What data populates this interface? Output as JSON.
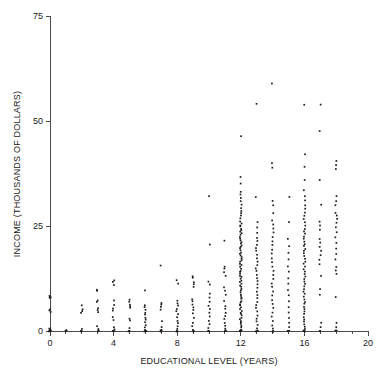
{
  "figure": {
    "clipped_title": "",
    "background_color": "#ffffff",
    "point_color": "#1c1c1c",
    "axis_color": "#4a4a4a"
  },
  "chart_data": {
    "type": "scatter",
    "title": "",
    "xlabel": "EDUCATIONAL LEVEL (YEARS)",
    "ylabel": "INCOME (THOUSANDS OF DOLLARS)",
    "xlim": [
      0,
      20
    ],
    "ylim": [
      0,
      75
    ],
    "xticks": [
      0,
      4,
      8,
      12,
      16,
      20
    ],
    "xticklabels": [
      "0",
      "4",
      "8",
      "12",
      "16",
      "20"
    ],
    "xminorticks": [
      1,
      2,
      3,
      5,
      6,
      7,
      9,
      10,
      11,
      13,
      14,
      15,
      17,
      18,
      19
    ],
    "yticks": [
      0,
      25,
      50,
      75
    ],
    "yticklabels": [
      "0",
      "25",
      "50",
      "75"
    ],
    "grid": false,
    "legend": null,
    "columns": [
      {
        "x": 0,
        "values": [
          0,
          0,
          0,
          0,
          0,
          0.4,
          0.6,
          4.5,
          4.8,
          5.2,
          7.8,
          8.0,
          8.2,
          8.4
        ]
      },
      {
        "x": 1,
        "values": [
          0,
          0,
          0.3
        ]
      },
      {
        "x": 2,
        "values": [
          0,
          0,
          0,
          0.5,
          4.4,
          4.8,
          5.1,
          6.0
        ]
      },
      {
        "x": 3,
        "values": [
          0,
          0,
          0,
          0.4,
          1.2,
          4.6,
          5.0,
          5.5,
          7.0,
          7.4,
          9.5,
          9.8
        ]
      },
      {
        "x": 4,
        "values": [
          0,
          0,
          0,
          0.3,
          1.0,
          2.6,
          3.2,
          4.8,
          5.4,
          6.2,
          7.2,
          11.0,
          11.6,
          12.0
        ]
      },
      {
        "x": 5,
        "values": [
          0,
          0,
          0,
          0.6,
          2.4,
          3.0,
          5.5,
          6.0,
          6.4,
          7.0,
          7.4
        ]
      },
      {
        "x": 6,
        "values": [
          0,
          0,
          0,
          0,
          0.3,
          0.8,
          1.4,
          2.0,
          2.6,
          3.2,
          3.8,
          4.4,
          5.0,
          5.6,
          6.0,
          9.6
        ]
      },
      {
        "x": 7,
        "values": [
          0,
          0,
          0,
          0.4,
          1.0,
          2.2,
          5.2,
          5.8,
          6.2,
          6.6,
          15.5
        ]
      },
      {
        "x": 8,
        "values": [
          0,
          0,
          0,
          0,
          0.5,
          1.2,
          1.8,
          2.4,
          3.2,
          4.0,
          4.6,
          5.2,
          6.0,
          6.6,
          7.2,
          11.4,
          12.2
        ]
      },
      {
        "x": 9,
        "values": [
          0,
          0,
          0,
          0.4,
          1.2,
          2.0,
          3.0,
          4.2,
          5.0,
          5.6,
          6.4,
          7.0,
          7.6,
          10.4,
          11.0,
          11.6,
          12.6,
          13.0
        ]
      },
      {
        "x": 10,
        "values": [
          0,
          0,
          0,
          0.6,
          1.5,
          2.4,
          3.6,
          4.4,
          5.2,
          6.0,
          7.0,
          8.0,
          8.8,
          11.0,
          11.8,
          20.6,
          32.0
        ]
      },
      {
        "x": 11,
        "values": [
          0,
          0,
          0,
          0,
          0.5,
          1.2,
          2.0,
          2.8,
          3.6,
          4.4,
          5.2,
          6.0,
          7.2,
          8.6,
          9.6,
          10.4,
          13.2,
          14.0,
          14.8,
          15.4,
          21.4
        ]
      },
      {
        "x": 12,
        "values": [
          0,
          0,
          0,
          0,
          0,
          0,
          0,
          0,
          0,
          0.4,
          0.8,
          1.2,
          1.6,
          2.0,
          2.4,
          2.8,
          3.2,
          3.6,
          4.0,
          4.4,
          4.8,
          5.2,
          5.6,
          6.0,
          6.4,
          6.8,
          7.2,
          7.6,
          8.0,
          8.4,
          8.8,
          9.2,
          9.6,
          10.0,
          10.4,
          10.8,
          11.2,
          11.6,
          12.0,
          12.4,
          12.8,
          13.2,
          13.6,
          14.0,
          14.4,
          14.8,
          15.2,
          15.6,
          16.0,
          16.4,
          16.8,
          17.2,
          17.6,
          18.0,
          18.4,
          18.8,
          19.2,
          19.6,
          20.0,
          20.4,
          20.8,
          21.2,
          21.6,
          22.0,
          22.4,
          22.8,
          23.2,
          23.6,
          24.0,
          24.4,
          24.8,
          25.2,
          25.6,
          26.2,
          26.8,
          27.4,
          28.0,
          28.6,
          29.2,
          30.0,
          30.8,
          31.6,
          32.4,
          33.2,
          35.0,
          36.8,
          46.5
        ]
      },
      {
        "x": 13,
        "values": [
          0,
          0,
          0,
          0,
          0.6,
          1.4,
          2.2,
          3.0,
          3.8,
          4.6,
          5.4,
          6.2,
          7.0,
          7.8,
          8.6,
          9.4,
          10.2,
          11.0,
          11.8,
          12.6,
          13.4,
          14.2,
          15.0,
          15.8,
          16.6,
          17.4,
          18.2,
          19.0,
          19.8,
          20.6,
          21.4,
          22.2,
          23.4,
          24.6,
          26.0,
          32.0,
          54.0
        ]
      },
      {
        "x": 14,
        "values": [
          0,
          0,
          0,
          0,
          0.6,
          1.4,
          2.4,
          3.4,
          4.4,
          5.4,
          6.4,
          7.4,
          8.4,
          9.4,
          10.4,
          11.4,
          12.4,
          13.4,
          14.4,
          15.4,
          16.4,
          17.4,
          18.4,
          19.4,
          20.4,
          21.4,
          22.4,
          23.4,
          24.4,
          25.4,
          26.4,
          28.0,
          30.0,
          31.0,
          39.0,
          40.0,
          59.0
        ]
      },
      {
        "x": 15,
        "values": [
          0,
          0,
          0,
          0.8,
          2.0,
          3.2,
          4.4,
          5.6,
          7.0,
          8.4,
          9.8,
          11.2,
          12.6,
          14.0,
          15.4,
          17.0,
          18.6,
          20.2,
          22.0,
          26.0,
          32.0
        ]
      },
      {
        "x": 16,
        "values": [
          0,
          0,
          0,
          0,
          0.5,
          1.0,
          1.6,
          2.2,
          2.8,
          3.4,
          4.0,
          4.6,
          5.2,
          5.8,
          6.4,
          7.0,
          7.6,
          8.2,
          8.8,
          9.4,
          10.0,
          10.6,
          11.2,
          11.8,
          12.4,
          13.0,
          13.6,
          14.2,
          14.8,
          15.4,
          16.0,
          16.6,
          17.2,
          17.8,
          18.4,
          19.0,
          19.6,
          20.2,
          20.8,
          21.4,
          22.0,
          22.6,
          23.2,
          23.8,
          24.4,
          25.0,
          25.8,
          26.6,
          27.4,
          28.2,
          29.0,
          30.0,
          31.0,
          32.2,
          33.4,
          36.0,
          39.0,
          42.0,
          54.0
        ]
      },
      {
        "x": 17,
        "values": [
          0,
          0,
          0.8,
          2.0,
          8.6,
          10.0,
          13.0,
          16.0,
          17.0,
          18.0,
          19.0,
          20.0,
          21.0,
          22.0,
          24.0,
          25.0,
          26.0,
          30.0,
          36.0,
          47.5,
          54.0
        ]
      },
      {
        "x": 18,
        "values": [
          0,
          0,
          0.8,
          2.0,
          8.0,
          13.6,
          14.4,
          15.2,
          17.0,
          18.4,
          19.6,
          21.0,
          22.2,
          23.4,
          24.6,
          25.8,
          26.6,
          27.4,
          28.2,
          30.0,
          31.0,
          32.2,
          38.6,
          39.6,
          40.4
        ]
      }
    ]
  }
}
